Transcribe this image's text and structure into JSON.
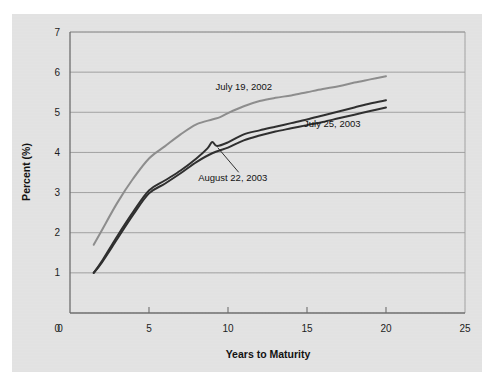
{
  "chart_data": {
    "type": "line",
    "title": "",
    "xlabel": "Years to Maturity",
    "ylabel": "Percent (%)",
    "xlim": [
      0,
      25
    ],
    "ylim": [
      0,
      7
    ],
    "xticks": [
      "0",
      "5",
      "10",
      "15",
      "20",
      "25"
    ],
    "yticks": [
      "0",
      "1",
      "2",
      "3",
      "4",
      "5",
      "6",
      "7"
    ],
    "grid": "horizontal",
    "legend_position": "inline-annotations",
    "background_color": "#e3e3e3",
    "series": [
      {
        "name": "July 19, 2002",
        "color": "#8d8d8d",
        "label_x": 11.0,
        "label_y": 5.55,
        "x": [
          1.5,
          2,
          3,
          4,
          5,
          6,
          7,
          8,
          9,
          9.5,
          10,
          11,
          12,
          13,
          14,
          15,
          16,
          17,
          18,
          19,
          20
        ],
        "y": [
          1.7,
          2.05,
          2.75,
          3.35,
          3.85,
          4.15,
          4.45,
          4.7,
          4.82,
          4.88,
          4.98,
          5.15,
          5.28,
          5.36,
          5.42,
          5.5,
          5.58,
          5.65,
          5.74,
          5.82,
          5.9
        ]
      },
      {
        "name": "July 25, 2003",
        "color": "#2e2e2e",
        "label_x": 16.6,
        "label_y": 4.63,
        "x": [
          1.5,
          2,
          3,
          4,
          5,
          6,
          7,
          8,
          8.7,
          9,
          9.3,
          10,
          11,
          12,
          13,
          14,
          15,
          16,
          17,
          18,
          19,
          20
        ],
        "y": [
          1.0,
          1.28,
          1.92,
          2.52,
          3.05,
          3.3,
          3.55,
          3.85,
          4.1,
          4.26,
          4.16,
          4.25,
          4.45,
          4.55,
          4.64,
          4.73,
          4.82,
          4.92,
          5.02,
          5.12,
          5.22,
          5.3
        ]
      },
      {
        "name": "August 22, 2003",
        "color": "#2e2e2e",
        "label_x": 10.3,
        "label_y": 3.28,
        "annotation_point_x": 9.35,
        "annotation_point_y": 4.12,
        "x": [
          1.5,
          2,
          3,
          4,
          5,
          6,
          7,
          8,
          9,
          10,
          11,
          12,
          13,
          14,
          15,
          16,
          17,
          18,
          19,
          20
        ],
        "y": [
          1.0,
          1.25,
          1.85,
          2.45,
          2.98,
          3.22,
          3.48,
          3.76,
          3.98,
          4.12,
          4.3,
          4.42,
          4.52,
          4.6,
          4.68,
          4.76,
          4.85,
          4.94,
          5.03,
          5.12
        ]
      }
    ]
  }
}
